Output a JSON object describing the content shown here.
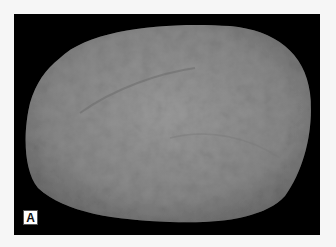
{
  "figure": {
    "panel_label": "A",
    "colors": {
      "background": "#000000",
      "specimen": "#8a8a8a",
      "border": "#f6f6f6"
    }
  }
}
